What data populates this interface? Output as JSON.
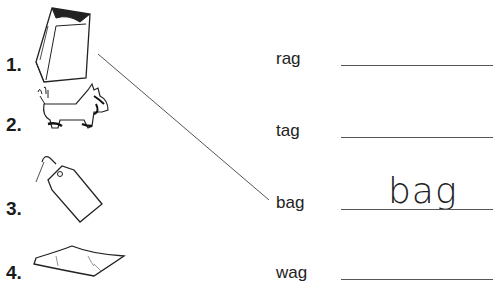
{
  "items": [
    {
      "number": "1.",
      "picture": "paper-bag"
    },
    {
      "number": "2.",
      "picture": "scottish-terrier-dog"
    },
    {
      "number": "3.",
      "picture": "price-tag"
    },
    {
      "number": "4.",
      "picture": "rag-cloth"
    }
  ],
  "words": [
    {
      "label": "rag",
      "answer": ""
    },
    {
      "label": "tag",
      "answer": ""
    },
    {
      "label": "bag",
      "answer": "bag"
    },
    {
      "label": "wag",
      "answer": ""
    }
  ],
  "match_line": {
    "from_item": "1.",
    "to_word": "bag",
    "color": "#555555"
  }
}
